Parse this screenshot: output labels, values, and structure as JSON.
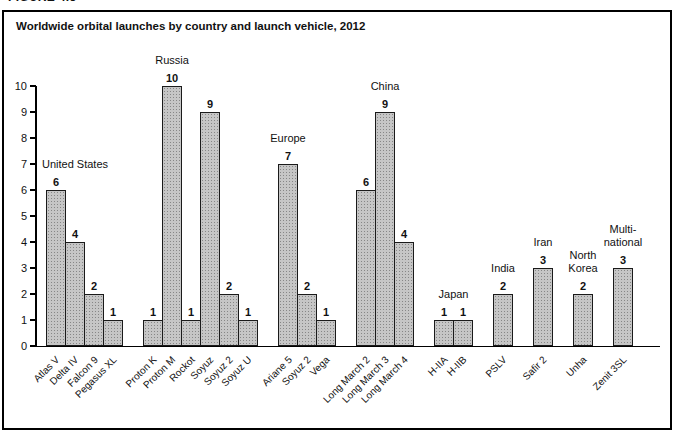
{
  "figure_label": "FIGURE 4.5",
  "chart": {
    "title": "Worldwide orbital launches by country and launch vehicle, 2012"
  },
  "chart_data": {
    "type": "bar",
    "title": "Worldwide orbital launches by country and launch vehicle, 2012",
    "xlabel": "",
    "ylabel": "",
    "ylim": [
      0,
      10
    ],
    "yticks": [
      0,
      1,
      2,
      3,
      4,
      5,
      6,
      7,
      8,
      9,
      10
    ],
    "grid": false,
    "legend": false,
    "bar_color": "#c6c6c6",
    "bar_pattern": "dotted-halftone",
    "groups": [
      {
        "country": "United States",
        "label_lines": [
          "United States"
        ],
        "label_anchor": 1,
        "categories": [
          "Atlas V",
          "Delta IV",
          "Falcon 9",
          "Pegasus XL"
        ],
        "values": [
          6,
          4,
          2,
          1
        ]
      },
      {
        "country": "Russia",
        "label_lines": [
          "Russia"
        ],
        "label_anchor": 1,
        "categories": [
          "Proton K",
          "Proton M",
          "Rockot",
          "Soyuz",
          "Soyuz 2",
          "Soyuz U"
        ],
        "values": [
          1,
          10,
          1,
          9,
          2,
          1
        ]
      },
      {
        "country": "Europe",
        "label_lines": [
          "Europe"
        ],
        "label_anchor": 0,
        "categories": [
          "Ariane 5",
          "Soyuz 2",
          "Vega"
        ],
        "values": [
          7,
          2,
          1
        ]
      },
      {
        "country": "China",
        "label_lines": [
          "China"
        ],
        "label_anchor": 1,
        "categories": [
          "Long March 2",
          "Long March 3",
          "Long March 4"
        ],
        "values": [
          6,
          9,
          4
        ]
      },
      {
        "country": "Japan",
        "label_lines": [
          "Japan"
        ],
        "label_anchor": 0.5,
        "categories": [
          "H-IIA",
          "H-IIB"
        ],
        "values": [
          1,
          1
        ]
      },
      {
        "country": "India",
        "label_lines": [
          "India"
        ],
        "label_anchor": 0,
        "categories": [
          "PSLV"
        ],
        "values": [
          2
        ]
      },
      {
        "country": "Iran",
        "label_lines": [
          "Iran"
        ],
        "label_anchor": 0,
        "categories": [
          "Safir 2"
        ],
        "values": [
          3
        ]
      },
      {
        "country": "North Korea",
        "label_lines": [
          "North",
          "Korea"
        ],
        "label_anchor": 0,
        "categories": [
          "Unha"
        ],
        "values": [
          2
        ]
      },
      {
        "country": "Multi-national",
        "label_lines": [
          "Multi-",
          "national"
        ],
        "label_anchor": 0,
        "categories": [
          "Zenit 3SL"
        ],
        "values": [
          3
        ]
      }
    ]
  }
}
